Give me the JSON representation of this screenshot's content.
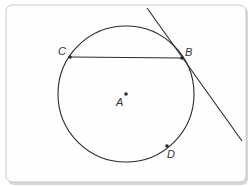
{
  "diagram": {
    "type": "geometry-circle-tangent",
    "colors": {
      "background": "#ffffff",
      "frame_fill": "#fefefe",
      "frame_stroke": "#c8c8c8",
      "frame_shadow": "#d8d8d8",
      "line": "#2a2a2a",
      "label": "#333333"
    },
    "circle": {
      "center_label": "A",
      "cx": 126,
      "cy": 94,
      "r": 68
    },
    "points": [
      {
        "label": "A",
        "x": 126,
        "y": 94,
        "label_x": 116,
        "label_y": 106
      },
      {
        "label": "B",
        "x": 182,
        "y": 58,
        "label_x": 185,
        "label_y": 56
      },
      {
        "label": "C",
        "x": 70,
        "y": 57,
        "label_x": 58,
        "label_y": 55
      },
      {
        "label": "D",
        "x": 167,
        "y": 146,
        "label_x": 167,
        "label_y": 158
      }
    ],
    "chord": {
      "from": "C",
      "to": "B"
    },
    "tangent": {
      "through": "B",
      "x1": 147,
      "y1": 8,
      "x2": 242,
      "y2": 141
    }
  }
}
